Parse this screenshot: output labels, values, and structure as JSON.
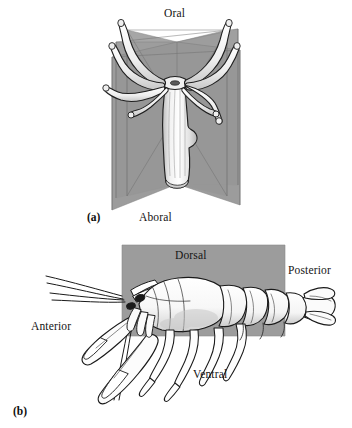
{
  "figure": {
    "panels": [
      {
        "id": "a",
        "panel_label": "(a)",
        "subject": "radially-symmetric-cnidarian-polyp",
        "labels": {
          "top": "Oral",
          "bottom": "Aboral"
        }
      },
      {
        "id": "b",
        "panel_label": "(b)",
        "subject": "bilaterally-symmetric-lobster",
        "labels": {
          "top": "Dorsal",
          "right": "Posterior",
          "left": "Anterior",
          "bottom": "Ventral"
        }
      }
    ]
  },
  "colors": {
    "plane_gray": "#9a9a9a",
    "plane_gray_dark": "#8d8d8d",
    "plane_gray_light": "#a8a8a8",
    "outline": "#1a1a1a",
    "body_fill": "#fdfdfd",
    "shade": "#d8d8d8",
    "background": "#ffffff",
    "text": "#141414"
  }
}
